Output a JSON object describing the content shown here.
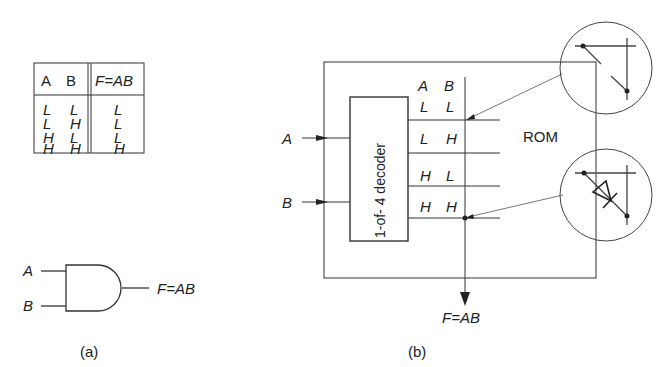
{
  "truth_table": {
    "headers": [
      "A",
      "B",
      "F=AB"
    ],
    "rows": [
      [
        "L",
        "L",
        "L"
      ],
      [
        "L",
        "H",
        "L"
      ],
      [
        "H",
        "L",
        "L"
      ],
      [
        "H",
        "H",
        "H"
      ]
    ]
  },
  "gate": {
    "input_a": "A",
    "input_b": "B",
    "output": "F=AB",
    "caption": "(a)"
  },
  "rom": {
    "input_a": "A",
    "input_b": "B",
    "decoder_label": "1-of- 4 decoder",
    "col_headers": [
      "A",
      "B"
    ],
    "rows": [
      [
        "L",
        "L"
      ],
      [
        "L",
        "H"
      ],
      [
        "H",
        "L"
      ],
      [
        "H",
        "H"
      ]
    ],
    "rom_label": "ROM",
    "output": "F=AB",
    "caption": "(b)"
  }
}
